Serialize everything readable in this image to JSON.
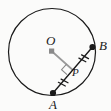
{
  "figure": {
    "type": "geometry-diagram",
    "background_color": "#fbfbfa",
    "stroke_color": "#1a1a1a",
    "accent_color": "#8a8a8a"
  },
  "labels": {
    "center": "O",
    "point_b": "B",
    "point_a": "A",
    "foot_p": "P"
  },
  "geometry": {
    "circle": {
      "cx": 52,
      "cy": 52,
      "r": 43.5,
      "stroke": "#1a1a1a",
      "stroke_width": 1.2,
      "fill": "none"
    },
    "center_marker": {
      "x": 51.5,
      "y": 51,
      "size": 5,
      "shape": "square",
      "color": "#8a8a8a"
    },
    "chord": {
      "name": "AB",
      "x1": 53,
      "y1": 93,
      "x2": 92.5,
      "y2": 47,
      "stroke": "#1a1a1a",
      "stroke_width": 1.3
    },
    "point_a": {
      "x": 53,
      "y": 93,
      "r": 3.1,
      "color": "#1a1a1a"
    },
    "point_b": {
      "x": 92.5,
      "y": 47,
      "r": 3.1,
      "color": "#1a1a1a"
    },
    "perpendicular": {
      "name": "OP",
      "x1": 51.5,
      "y1": 51,
      "x2": 72.8,
      "y2": 70,
      "stroke": "#9a9a9a",
      "stroke_width": 1.6
    },
    "right_angle_marker": {
      "at_x": 72.8,
      "at_y": 70,
      "size": 9,
      "stroke": "#8a8a8a",
      "stroke_width": 1.1
    },
    "tick_marks": {
      "count_per_segment": 2,
      "segments": [
        "AP",
        "PB"
      ],
      "length": 8,
      "spacing": 4,
      "stroke": "#1a1a1a",
      "stroke_width": 1.2
    }
  }
}
